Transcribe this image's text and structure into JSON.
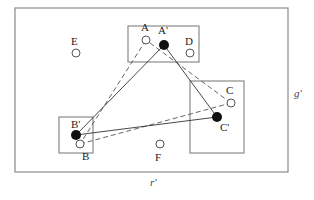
{
  "diagram": {
    "outer_region": {
      "x": 15,
      "y": 8,
      "w": 273,
      "h": 164
    },
    "axis_labels": {
      "horizontal": {
        "text": "r'",
        "x": 150,
        "y": 186
      },
      "vertical": {
        "text": "g'",
        "x": 294,
        "y": 97
      }
    },
    "boxes": [
      {
        "id": "box-top",
        "x": 128,
        "y": 26,
        "w": 71,
        "h": 36
      },
      {
        "id": "box-left",
        "x": 59,
        "y": 117,
        "w": 34,
        "h": 36
      },
      {
        "id": "box-right",
        "x": 190,
        "y": 81,
        "w": 54,
        "h": 72
      }
    ],
    "points": [
      {
        "id": "A",
        "label": "A",
        "cx": 146,
        "cy": 40,
        "filled": false,
        "lx": 141,
        "ly": 31
      },
      {
        "id": "A-prime",
        "label": "A'",
        "cx": 164,
        "cy": 45,
        "filled": true,
        "lx": 158,
        "ly": 34
      },
      {
        "id": "D",
        "label": "D",
        "cx": 190,
        "cy": 53,
        "filled": false,
        "lx": 185,
        "ly": 45
      },
      {
        "id": "E",
        "label": "E",
        "cx": 76,
        "cy": 53,
        "filled": false,
        "lx": 71,
        "ly": 45
      },
      {
        "id": "B-prime",
        "label": "B'",
        "cx": 76,
        "cy": 135,
        "filled": true,
        "lx": 71,
        "ly": 128
      },
      {
        "id": "B",
        "label": "B",
        "cx": 80,
        "cy": 144,
        "filled": false,
        "lx": 82,
        "ly": 160
      },
      {
        "id": "F",
        "label": "F",
        "cx": 160,
        "cy": 144,
        "filled": false,
        "lx": 155,
        "ly": 161
      },
      {
        "id": "C",
        "label": "C",
        "cx": 231,
        "cy": 103,
        "filled": false,
        "lx": 226,
        "ly": 94
      },
      {
        "id": "C-prime",
        "label": "C'",
        "cx": 217,
        "cy": 117,
        "filled": true,
        "lx": 220,
        "ly": 131
      }
    ],
    "solid_triangle": {
      "vertices": [
        "A-prime",
        "B-prime",
        "C-prime"
      ]
    },
    "dashed_triangle": {
      "vertices": [
        "A",
        "B",
        "C"
      ]
    },
    "colors": {
      "box_stroke": "#8a8a8a",
      "line": "#333333",
      "dashed_line": "#555555",
      "filled_point": "#111111",
      "hollow_point_stroke": "#444444"
    }
  }
}
